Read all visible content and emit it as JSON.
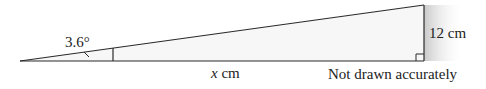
{
  "diagram": {
    "type": "right-triangle",
    "angle_label": "3.6°",
    "base_variable": "x",
    "base_unit": " cm",
    "height_label": "12 cm",
    "note": "Not drawn accurately",
    "colors": {
      "stroke": "#2a2a2a",
      "shade": "#cfcfcf",
      "fill": "#f6f6f6"
    }
  }
}
